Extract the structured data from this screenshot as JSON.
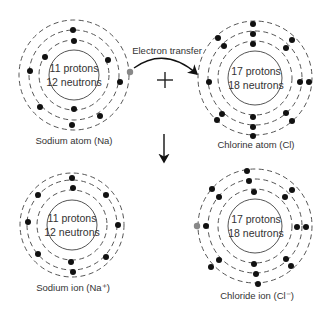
{
  "diagram": {
    "transfer_label": "Electron transfer",
    "plus_symbol": "+",
    "colors": {
      "electron": "#111111",
      "transferred_electron": "#888888",
      "lines": "#555555"
    },
    "atoms": [
      {
        "id": "sodium-atom",
        "label": "Sodium atom (Na)",
        "protons": "11 protons",
        "neutrons": "12 neutrons",
        "electrons": 11
      },
      {
        "id": "chlorine-atom",
        "label": "Chlorine atom (Cl)",
        "protons": "17 protons",
        "neutrons": "18 neutrons",
        "electrons": 17
      },
      {
        "id": "sodium-ion",
        "label": "Sodium ion (Na⁺)",
        "protons": "11 protons",
        "neutrons": "12 neutrons",
        "electrons": 10
      },
      {
        "id": "chloride-ion",
        "label": "Chloride ion (Cl⁻)",
        "protons": "17 protons",
        "neutrons": "18 neutrons",
        "electrons": 18
      }
    ]
  }
}
